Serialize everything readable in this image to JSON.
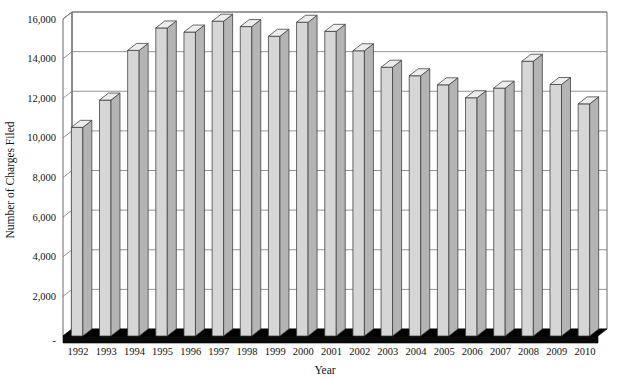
{
  "chart_data": {
    "type": "bar",
    "title": "",
    "xlabel": "Year",
    "ylabel": "Number of Charges Filed",
    "categories": [
      "1992",
      "1993",
      "1994",
      "1995",
      "1996",
      "1997",
      "1998",
      "1999",
      "2000",
      "2001",
      "2002",
      "2003",
      "2004",
      "2005",
      "2006",
      "2007",
      "2008",
      "2009",
      "2010"
    ],
    "values": [
      10532,
      11908,
      14416,
      15549,
      15342,
      15889,
      15618,
      15130,
      15836,
      15377,
      14396,
      13566,
      13136,
      12679,
      12025,
      12510,
      13867,
      12696,
      11717
    ],
    "series": [
      {
        "name": "Number of Charges Filed",
        "values": [
          10532,
          11908,
          14416,
          15549,
          15342,
          15889,
          15618,
          15130,
          15836,
          15377,
          14396,
          13566,
          13136,
          12679,
          12025,
          12510,
          13867,
          12696,
          11717
        ]
      }
    ],
    "ylim": [
      0,
      16000
    ],
    "ytick_values": [
      2000,
      4000,
      6000,
      8000,
      10000,
      12000,
      14000,
      16000
    ],
    "ytick_labels": [
      "2,000",
      "4,000",
      "6,000",
      "8,000",
      "10,000",
      "12,000",
      "14,000",
      "16,000"
    ],
    "grid": true,
    "legend": false,
    "legend_position": "none",
    "style": "3d-column",
    "bar_fill_color": "#d6d6d6",
    "bar_side_color": "#b4b4b4",
    "bar_top_color": "#ededed",
    "bar_edge_color": "#3a3a3a",
    "gridline_color": "#7a7a7a",
    "floor_color": "#000000",
    "background_color": "#ffffff"
  }
}
